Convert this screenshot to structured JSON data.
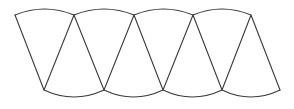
{
  "diagram": {
    "title": "Alternating curved-triangle strip",
    "stroke_color": "#3a3a3a",
    "background": "#ffffff",
    "top_vertices": [
      [
        15,
        15
      ],
      [
        74,
        15
      ],
      [
        134,
        15
      ],
      [
        193,
        15
      ],
      [
        251,
        15
      ]
    ],
    "bottom_vertices": [
      [
        44,
        90
      ],
      [
        104,
        90
      ],
      [
        163,
        90
      ],
      [
        222,
        90
      ],
      [
        280,
        90
      ]
    ],
    "top_arc_peak_offset": -6,
    "bottom_arc_sag_offset": 7,
    "segments": [
      {
        "type": "top-arc",
        "from": 0,
        "to": 1
      },
      {
        "type": "top-arc",
        "from": 1,
        "to": 2
      },
      {
        "type": "top-arc",
        "from": 2,
        "to": 3
      },
      {
        "type": "top-arc",
        "from": 3,
        "to": 4
      },
      {
        "type": "bottom-arc",
        "from": 0,
        "to": 1
      },
      {
        "type": "bottom-arc",
        "from": 1,
        "to": 2
      },
      {
        "type": "bottom-arc",
        "from": 2,
        "to": 3
      },
      {
        "type": "bottom-arc",
        "from": 3,
        "to": 4
      }
    ]
  }
}
